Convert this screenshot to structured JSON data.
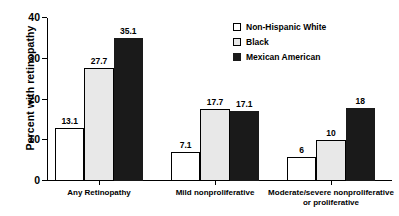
{
  "chart_data": {
    "type": "bar",
    "title": "",
    "subtitle": "",
    "xlabel": "",
    "ylabel": "Percent with retinopathy",
    "ylim": [
      0,
      40
    ],
    "yticks": [
      0,
      10,
      20,
      30,
      40
    ],
    "ytick_labels": [
      "0",
      "10",
      "20",
      "30",
      "40"
    ],
    "grid": false,
    "legend_position": "top-right",
    "categories": [
      "Any Retinopathy",
      "Mild nonproliferative",
      "Moderate/severe nonproliferative or proliferative"
    ],
    "category_lines": [
      [
        "Any Retinopathy"
      ],
      [
        "Mild nonproliferative"
      ],
      [
        "Moderate/severe nonproliferative",
        "or proliferative"
      ]
    ],
    "series": [
      {
        "name": "Non-Hispanic White",
        "swatch": "white",
        "color": "#ffffff",
        "values": [
          13.1,
          7.1,
          6
        ],
        "labels": [
          "13.1",
          "7.1",
          "6"
        ]
      },
      {
        "name": "Black",
        "swatch": "gray",
        "color": "#e8e8e8",
        "values": [
          27.7,
          17.7,
          10
        ],
        "labels": [
          "27.7",
          "17.7",
          "10"
        ]
      },
      {
        "name": "Mexican American",
        "swatch": "black",
        "color": "#1a1a1a",
        "values": [
          35.1,
          17.1,
          18
        ],
        "labels": [
          "35.1",
          "17.1",
          "18"
        ]
      }
    ]
  },
  "legend": {
    "items": [
      {
        "label": "Non-Hispanic White",
        "swatch": "white"
      },
      {
        "label": "Black",
        "swatch": "gray"
      },
      {
        "label": "Mexican American",
        "swatch": "black"
      }
    ]
  },
  "axes": {
    "y_title": "Percent with retinopathy",
    "y_labels": [
      "0",
      "10",
      "20",
      "30",
      "40"
    ]
  }
}
